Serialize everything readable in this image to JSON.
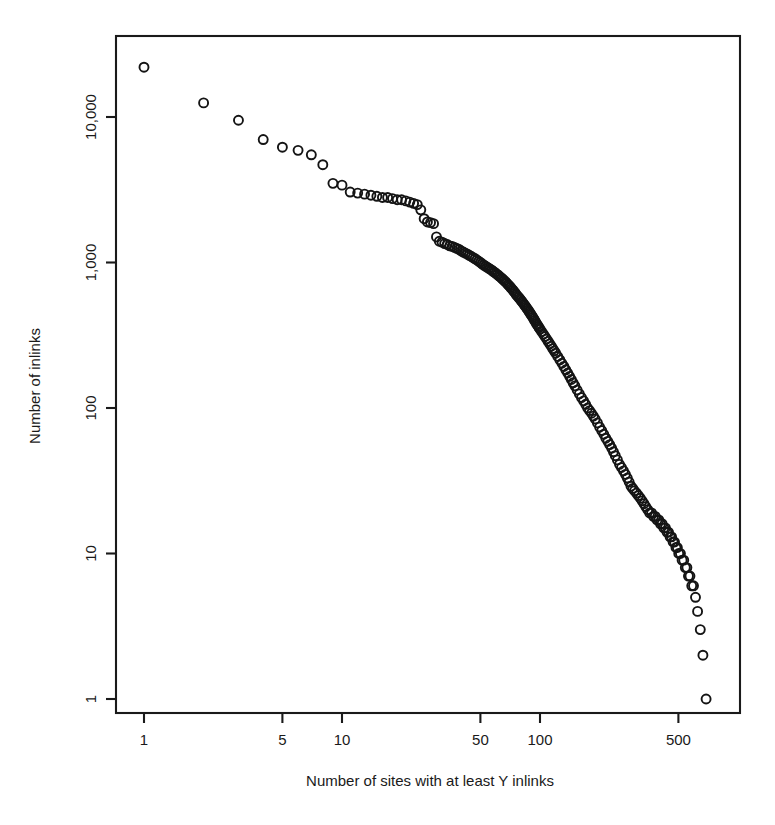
{
  "chart_data": {
    "type": "scatter",
    "title": "",
    "subtitle": "",
    "xlabel": "Number of sites with at least Y inlinks",
    "ylabel": "Number of inlinks",
    "xscale": "log",
    "yscale": "log",
    "xlim": [
      0.92,
      850
    ],
    "ylim": [
      0.9,
      33000
    ],
    "grid": false,
    "legend": null,
    "legend_position": "none",
    "marker": "open-circle",
    "marker_color": "#141414",
    "marker_size_px": 9,
    "xticks": [
      1,
      5,
      10,
      50,
      100,
      500
    ],
    "xtick_labels": [
      "1",
      "5",
      "10",
      "50",
      "100",
      "500"
    ],
    "yticks": [
      1,
      10,
      100,
      1000,
      10000
    ],
    "ytick_labels": [
      "1",
      "10",
      "100",
      "1,000",
      "10,000"
    ],
    "series": [
      {
        "name": "inlinks rank-size distribution",
        "x": [
          1,
          2,
          3,
          4,
          5,
          6,
          7,
          8,
          9,
          10,
          11,
          12,
          13,
          14,
          15,
          16,
          17,
          18,
          19,
          20,
          21,
          22,
          23,
          24,
          25,
          26,
          27,
          28,
          29,
          30,
          31,
          32,
          33,
          34,
          35,
          36,
          37,
          38,
          39,
          40,
          41,
          42,
          43,
          44,
          45,
          46,
          47,
          48,
          49,
          50,
          51,
          52,
          53,
          54,
          55,
          56,
          57,
          58,
          59,
          60,
          61,
          62,
          63,
          64,
          65,
          66,
          67,
          68,
          69,
          70,
          71,
          72,
          73,
          74,
          75,
          76,
          77,
          78,
          79,
          80,
          81,
          82,
          83,
          84,
          85,
          86,
          87,
          88,
          89,
          90,
          91,
          92,
          93,
          94,
          95,
          96,
          97,
          98,
          99,
          100,
          102,
          104,
          106,
          108,
          110,
          112,
          114,
          116,
          118,
          120,
          123,
          126,
          129,
          132,
          135,
          138,
          141,
          144,
          147,
          150,
          154,
          158,
          162,
          166,
          170,
          174,
          178,
          182,
          186,
          190,
          195,
          200,
          205,
          210,
          215,
          220,
          225,
          230,
          235,
          240,
          246,
          252,
          258,
          264,
          270,
          276,
          282,
          288,
          294,
          300,
          307,
          314,
          321,
          328,
          335,
          342,
          350,
          358,
          366,
          374,
          382,
          390,
          398,
          406,
          414,
          422,
          430,
          438,
          446,
          454,
          462,
          470,
          478,
          486,
          494,
          502,
          512,
          522,
          532,
          542,
          552,
          562,
          572,
          584,
          596,
          610,
          625,
          645,
          665,
          690
        ],
        "y": [
          22000,
          12500,
          9500,
          7000,
          6200,
          5900,
          5500,
          4700,
          3500,
          3400,
          3050,
          3000,
          2950,
          2900,
          2850,
          2800,
          2800,
          2750,
          2700,
          2700,
          2650,
          2600,
          2550,
          2500,
          2300,
          2000,
          1900,
          1880,
          1850,
          1500,
          1400,
          1380,
          1350,
          1330,
          1300,
          1290,
          1270,
          1250,
          1230,
          1200,
          1180,
          1160,
          1140,
          1120,
          1100,
          1080,
          1060,
          1040,
          1020,
          1000,
          980,
          960,
          945,
          930,
          915,
          900,
          885,
          870,
          855,
          840,
          825,
          810,
          795,
          780,
          765,
          750,
          735,
          720,
          705,
          690,
          675,
          660,
          645,
          630,
          615,
          600,
          588,
          576,
          564,
          552,
          540,
          528,
          516,
          505,
          494,
          483,
          472,
          461,
          450,
          440,
          430,
          420,
          410,
          400,
          390,
          380,
          372,
          364,
          356,
          348,
          335,
          322,
          310,
          298,
          287,
          276,
          266,
          256,
          247,
          238,
          226,
          214,
          203,
          193,
          183,
          174,
          165,
          157,
          149,
          142,
          133,
          125,
          118,
          112,
          106,
          100,
          96,
          92,
          88,
          84,
          79,
          74,
          70,
          66,
          62,
          59,
          56,
          53,
          50,
          47,
          44,
          41,
          39,
          37,
          35,
          33,
          31,
          29,
          28,
          27,
          26,
          25,
          24,
          23,
          22,
          21,
          20,
          19,
          19,
          18,
          18,
          17,
          17,
          16,
          16,
          15,
          15,
          14,
          14,
          13,
          13,
          12,
          12,
          11,
          11,
          10,
          10,
          9,
          9,
          8,
          8,
          7,
          7,
          6,
          6,
          5,
          4,
          3,
          2,
          1
        ]
      }
    ]
  }
}
